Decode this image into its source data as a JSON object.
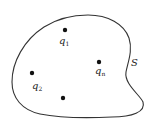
{
  "diagram": {
    "surface": {
      "label": "S",
      "stroke": "#333333"
    },
    "charges": [
      {
        "name": "q",
        "sub": "1",
        "x": 65,
        "y": 30
      },
      {
        "name": "q",
        "sub": "n",
        "x": 99,
        "y": 62
      },
      {
        "name": "q",
        "sub": "2",
        "x": 32,
        "y": 73
      },
      {
        "name": "",
        "sub": "",
        "x": 63,
        "y": 98
      }
    ]
  }
}
